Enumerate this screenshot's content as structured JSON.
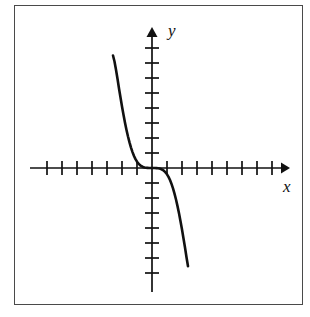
{
  "figure": {
    "title": "",
    "caption": "",
    "background_color": "#ffffff",
    "frame_color": "#4a4a4a",
    "ink_color": "#111111"
  },
  "axes": {
    "x_label": "x",
    "y_label": "y",
    "x_arrow": "arrow-right",
    "y_arrow": "arrow-up",
    "x_tick_count_left": 6,
    "x_tick_count_right": 7,
    "y_tick_count_above": 7,
    "y_tick_count_below": 8,
    "tick_spacing_px": 15,
    "origin_px": {
      "x": 152,
      "y": 168
    },
    "x_axis_start_px": 30,
    "x_axis_end_px": 288,
    "y_axis_start_px": 30,
    "y_axis_end_px": 290
  },
  "chart_data": {
    "type": "line",
    "title": "",
    "subtitle": "",
    "xlabel": "x",
    "ylabel": "y",
    "xlim": [
      -8.1,
      9.1
    ],
    "ylim": [
      -8.1,
      7.6
    ],
    "grid": false,
    "legend": null,
    "annotations": [],
    "x_ticks": [
      -6,
      -5,
      -4,
      -3,
      -2,
      -1,
      1,
      2,
      3,
      4,
      5,
      6,
      7
    ],
    "y_ticks": [
      -8,
      -7,
      -6,
      -5,
      -4,
      -3,
      -2,
      -1,
      1,
      2,
      3,
      4,
      5,
      6,
      7
    ],
    "tick_labels_shown": false,
    "series": [
      {
        "name": "curve",
        "description": "decreasing odd power function through the origin, flat near x = 0",
        "equation": "y = -x^5",
        "x": [
          -2.6,
          -2.5,
          -2.4,
          -2.3,
          -2.2,
          -2.1,
          -2.0,
          -1.9,
          -1.8,
          -1.7,
          -1.6,
          -1.5,
          -1.4,
          -1.3,
          -1.2,
          -1.1,
          -1.0,
          -0.9,
          -0.8,
          -0.7,
          -0.6,
          -0.5,
          -0.4,
          -0.3,
          -0.2,
          -0.1,
          0.0,
          0.1,
          0.2,
          0.3,
          0.4,
          0.5,
          0.6,
          0.7,
          0.8,
          0.9,
          1.0,
          1.1,
          1.2,
          1.3,
          1.4,
          1.5,
          1.6,
          1.7,
          1.8,
          1.9,
          2.0,
          2.1,
          2.2,
          2.3,
          2.4
        ],
        "y": [
          7.5,
          7.1,
          6.55,
          5.95,
          5.3,
          4.7,
          4.1,
          3.55,
          3.02,
          2.54,
          2.1,
          1.71,
          1.36,
          1.06,
          0.8,
          0.59,
          0.42,
          0.29,
          0.19,
          0.12,
          0.07,
          0.04,
          0.02,
          0.01,
          0.0,
          0.0,
          0.0,
          0.0,
          0.0,
          -0.01,
          -0.02,
          -0.04,
          -0.07,
          -0.12,
          -0.19,
          -0.29,
          -0.42,
          -0.59,
          -0.8,
          -1.06,
          -1.36,
          -1.71,
          -2.1,
          -2.54,
          -3.02,
          -3.55,
          -4.1,
          -4.7,
          -5.3,
          -5.95,
          -6.55
        ]
      }
    ]
  }
}
